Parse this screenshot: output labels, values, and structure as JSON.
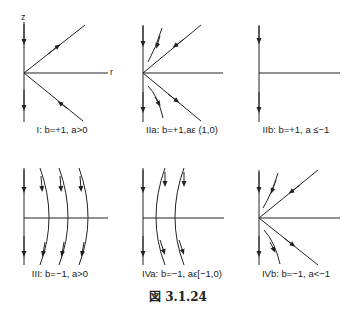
{
  "figure": {
    "caption": "図 3.1.24",
    "axis_labels": {
      "z": "z",
      "r": "r"
    },
    "panels": [
      {
        "id": "I",
        "label": "I: b=+1, a>0"
      },
      {
        "id": "IIa",
        "label": "IIa: b=+1,aε (1,0)"
      },
      {
        "id": "IIb",
        "label": "IIb: b=+1, a ≤−1"
      },
      {
        "id": "III",
        "label": "III: b=−1, a>0"
      },
      {
        "id": "IVa",
        "label": "IVa: b=−1, aε[−1,0)"
      },
      {
        "id": "IVb",
        "label": "IVb: b=−1, a<−1"
      }
    ],
    "colors": {
      "line": "#222222",
      "background": "#ffffff"
    }
  }
}
